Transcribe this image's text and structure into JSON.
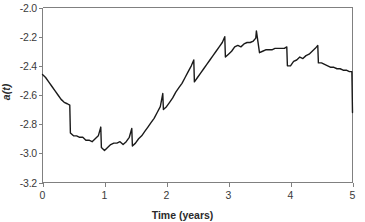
{
  "chart_data": {
    "type": "line",
    "title": "",
    "xlabel": "Time (years)",
    "ylabel": "a(t)",
    "xlim": [
      0,
      5
    ],
    "ylim": [
      -3.2,
      -2.0
    ],
    "grid": false,
    "legend": null,
    "xticks": [
      "0",
      "1",
      "2",
      "3",
      "4",
      "5"
    ],
    "xtick_values": [
      0,
      1,
      2,
      3,
      4,
      5
    ],
    "yticks": [
      "-2.0",
      "-2.2",
      "-2.4",
      "-2.6",
      "-2.8",
      "-3.0",
      "-3.2"
    ],
    "ytick_values": [
      -2.0,
      -2.2,
      -2.4,
      -2.6,
      -2.8,
      -3.0,
      -3.2
    ],
    "series": [
      {
        "name": "a(t)",
        "color": "#1a1a1a",
        "x": [
          0.0,
          0.05,
          0.1,
          0.15,
          0.2,
          0.25,
          0.3,
          0.35,
          0.4,
          0.44,
          0.45,
          0.5,
          0.55,
          0.6,
          0.65,
          0.7,
          0.75,
          0.8,
          0.85,
          0.9,
          0.94,
          0.95,
          1.0,
          1.05,
          1.1,
          1.15,
          1.2,
          1.25,
          1.3,
          1.35,
          1.4,
          1.44,
          1.45,
          1.5,
          1.55,
          1.6,
          1.65,
          1.7,
          1.75,
          1.8,
          1.85,
          1.9,
          1.94,
          1.95,
          2.0,
          2.05,
          2.1,
          2.15,
          2.2,
          2.25,
          2.3,
          2.35,
          2.4,
          2.44,
          2.45,
          2.5,
          2.55,
          2.6,
          2.65,
          2.7,
          2.75,
          2.8,
          2.85,
          2.9,
          2.94,
          2.95,
          3.0,
          3.05,
          3.1,
          3.15,
          3.2,
          3.25,
          3.3,
          3.35,
          3.4,
          3.44,
          3.45,
          3.5,
          3.55,
          3.6,
          3.65,
          3.7,
          3.75,
          3.8,
          3.85,
          3.9,
          3.94,
          3.95,
          4.0,
          4.05,
          4.1,
          4.15,
          4.2,
          4.25,
          4.3,
          4.35,
          4.4,
          4.44,
          4.45,
          4.5,
          4.55,
          4.6,
          4.65,
          4.7,
          4.75,
          4.8,
          4.85,
          4.9,
          4.95,
          4.99,
          5.0
        ],
        "y": [
          -2.46,
          -2.48,
          -2.51,
          -2.54,
          -2.57,
          -2.6,
          -2.63,
          -2.65,
          -2.66,
          -2.67,
          -2.86,
          -2.88,
          -2.88,
          -2.89,
          -2.89,
          -2.91,
          -2.91,
          -2.92,
          -2.9,
          -2.88,
          -2.82,
          -2.96,
          -2.98,
          -2.96,
          -2.94,
          -2.93,
          -2.93,
          -2.92,
          -2.94,
          -2.92,
          -2.89,
          -2.83,
          -2.95,
          -2.93,
          -2.9,
          -2.88,
          -2.85,
          -2.82,
          -2.79,
          -2.76,
          -2.72,
          -2.68,
          -2.59,
          -2.7,
          -2.68,
          -2.65,
          -2.62,
          -2.58,
          -2.55,
          -2.52,
          -2.48,
          -2.44,
          -2.4,
          -2.36,
          -2.51,
          -2.48,
          -2.45,
          -2.42,
          -2.39,
          -2.36,
          -2.33,
          -2.3,
          -2.27,
          -2.24,
          -2.2,
          -2.34,
          -2.32,
          -2.3,
          -2.27,
          -2.26,
          -2.27,
          -2.25,
          -2.24,
          -2.24,
          -2.23,
          -2.21,
          -2.16,
          -2.31,
          -2.3,
          -2.29,
          -2.29,
          -2.29,
          -2.28,
          -2.28,
          -2.28,
          -2.28,
          -2.27,
          -2.4,
          -2.4,
          -2.37,
          -2.36,
          -2.34,
          -2.35,
          -2.33,
          -2.32,
          -2.3,
          -2.28,
          -2.26,
          -2.38,
          -2.38,
          -2.39,
          -2.4,
          -2.41,
          -2.41,
          -2.42,
          -2.42,
          -2.43,
          -2.43,
          -2.44,
          -2.44,
          -2.72
        ]
      }
    ]
  },
  "axes": {
    "y_title": "a(t)",
    "x_title": "Time (years)"
  }
}
